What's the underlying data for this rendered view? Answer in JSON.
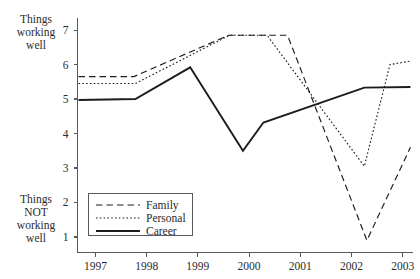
{
  "chart_data": {
    "type": "line",
    "title": "",
    "xlabel": "",
    "ylabel": "",
    "x": [
      "1997",
      "1998",
      "1999",
      "2000",
      "2001",
      "2002",
      "2003"
    ],
    "xlim": [
      1996.65,
      2003.2
    ],
    "ylim": [
      0.55,
      7.35
    ],
    "yticks": [
      1,
      2,
      3,
      4,
      5,
      6,
      7
    ],
    "ytick_labels": [
      "1",
      "2",
      "3",
      "4",
      "5",
      "6",
      "7"
    ],
    "grid": false,
    "legend_position": "lower-left-inside",
    "axis_top_label": "Things working well",
    "axis_bottom_label": "Things NOT working well",
    "series": [
      {
        "name": "Family",
        "style": "dashed",
        "points": [
          {
            "x": 1996.67,
            "y": 5.65
          },
          {
            "x": 1997.75,
            "y": 5.65
          },
          {
            "x": 1999.6,
            "y": 6.85
          },
          {
            "x": 2000.75,
            "y": 6.85
          },
          {
            "x": 2002.3,
            "y": 0.9
          },
          {
            "x": 2003.15,
            "y": 3.6
          }
        ]
      },
      {
        "name": "Personal",
        "style": "dotted",
        "points": [
          {
            "x": 1996.67,
            "y": 5.45
          },
          {
            "x": 1997.78,
            "y": 5.45
          },
          {
            "x": 1999.62,
            "y": 6.85
          },
          {
            "x": 2000.35,
            "y": 6.85
          },
          {
            "x": 2002.25,
            "y": 3.05
          },
          {
            "x": 2002.75,
            "y": 6.0
          },
          {
            "x": 2003.15,
            "y": 6.1
          }
        ]
      },
      {
        "name": "Career",
        "style": "solid",
        "points": [
          {
            "x": 1996.67,
            "y": 4.97
          },
          {
            "x": 1997.78,
            "y": 5.0
          },
          {
            "x": 1998.85,
            "y": 5.92
          },
          {
            "x": 1999.88,
            "y": 3.5
          },
          {
            "x": 2000.28,
            "y": 4.32
          },
          {
            "x": 2002.25,
            "y": 5.33
          },
          {
            "x": 2003.15,
            "y": 5.35
          }
        ]
      }
    ],
    "legend_entries": [
      {
        "label": "Family",
        "style": "dashed"
      },
      {
        "label": "Personal",
        "style": "dotted"
      },
      {
        "label": "Career",
        "style": "solid"
      }
    ]
  },
  "labels": {
    "top_left_lines": [
      "Things",
      "working",
      "well"
    ],
    "bottom_left_lines": [
      "Things",
      "NOT",
      "working",
      "well"
    ]
  }
}
